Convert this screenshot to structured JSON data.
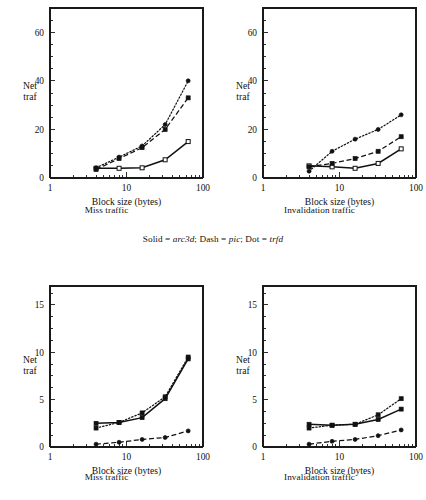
{
  "figure": {
    "legend_prefix_solid": "Solid = ",
    "legend_solid_name": "arc3d",
    "legend_mid1": "; Dash = ",
    "legend_dash_name": "pic",
    "legend_mid2": "; Dot = ",
    "legend_dot_name": "trfd",
    "legend_full": "Solid = arc3d; Dash = pic; Dot = trfd"
  },
  "axes": {
    "xlabel": "Block size (bytes)",
    "ylabel_line1": "Net",
    "ylabel_line2": "traf",
    "x_tick_labels": [
      "1",
      "10",
      "100"
    ],
    "y_tick_labels_top": [
      "0",
      "20",
      "40",
      "60"
    ],
    "y_tick_labels_bottom": [
      "0",
      "5",
      "10",
      "15"
    ]
  },
  "captions": {
    "miss": "Miss traffic",
    "invalidation": "Invalidation traffic"
  },
  "chart_data": [
    {
      "id": "top-left",
      "type": "line",
      "title": "Miss traffic",
      "subtitle": "",
      "xlabel": "Block size (bytes)",
      "ylabel": "Net traf",
      "xscale": "log",
      "xlim": [
        1,
        100
      ],
      "ylim": [
        0,
        70
      ],
      "yticks": [
        0,
        20,
        40,
        60
      ],
      "xticks": [
        1,
        10,
        100
      ],
      "grid": false,
      "legend_position": "external-center",
      "x": [
        4,
        8,
        16,
        32,
        64
      ],
      "series": [
        {
          "name": "arc3d",
          "style": "solid",
          "marker": "open-square",
          "values": [
            4.0,
            4.0,
            4.2,
            7.5,
            15.0
          ]
        },
        {
          "name": "pic",
          "style": "dash",
          "marker": "filled-square",
          "values": [
            3.5,
            8.0,
            12.5,
            20.0,
            33.0
          ]
        },
        {
          "name": "trfd",
          "style": "dot",
          "marker": "filled-circle",
          "values": [
            4.2,
            8.6,
            13.2,
            22.0,
            40.0
          ]
        }
      ]
    },
    {
      "id": "top-right",
      "type": "line",
      "title": "Invalidation traffic",
      "subtitle": "",
      "xlabel": "Block size (bytes)",
      "ylabel": "Net traf",
      "xscale": "log",
      "xlim": [
        1,
        100
      ],
      "ylim": [
        0,
        70
      ],
      "yticks": [
        0,
        20,
        40,
        60
      ],
      "xticks": [
        1,
        10,
        100
      ],
      "grid": false,
      "legend_position": "external-center",
      "x": [
        4,
        8,
        16,
        32,
        64
      ],
      "series": [
        {
          "name": "arc3d",
          "style": "solid",
          "marker": "open-square",
          "values": [
            5.0,
            4.6,
            4.0,
            6.0,
            12.0
          ]
        },
        {
          "name": "pic",
          "style": "dash",
          "marker": "filled-square",
          "values": [
            4.6,
            6.0,
            8.0,
            11.0,
            17.0
          ]
        },
        {
          "name": "trfd",
          "style": "dot",
          "marker": "filled-circle",
          "values": [
            2.8,
            11.0,
            16.0,
            20.0,
            26.0
          ]
        }
      ]
    },
    {
      "id": "bottom-left",
      "type": "line",
      "title": "Miss traffic",
      "subtitle": "",
      "xlabel": "Block size (bytes)",
      "ylabel": "Net traf",
      "xscale": "log",
      "xlim": [
        1,
        100
      ],
      "ylim": [
        0,
        17
      ],
      "yticks": [
        0,
        5,
        10,
        15
      ],
      "xticks": [
        1,
        10,
        100
      ],
      "grid": false,
      "legend_position": "external-center",
      "x": [
        4,
        8,
        16,
        32,
        64
      ],
      "series": [
        {
          "name": "arc3d",
          "style": "solid",
          "marker": "filled-square",
          "values": [
            2.5,
            2.6,
            3.1,
            5.1,
            9.3
          ]
        },
        {
          "name": "pic",
          "style": "dash",
          "marker": "filled-circle",
          "values": [
            0.3,
            0.5,
            0.8,
            1.0,
            1.7
          ]
        },
        {
          "name": "trfd",
          "style": "dot",
          "marker": "filled-square",
          "values": [
            2.0,
            2.6,
            3.6,
            5.3,
            9.5
          ]
        }
      ]
    },
    {
      "id": "bottom-right",
      "type": "line",
      "title": "Invalidation traffic",
      "subtitle": "",
      "xlabel": "Block size (bytes)",
      "ylabel": "Net traf",
      "xscale": "log",
      "xlim": [
        1,
        100
      ],
      "ylim": [
        0,
        17
      ],
      "yticks": [
        0,
        5,
        10,
        15
      ],
      "xticks": [
        1,
        10,
        100
      ],
      "grid": false,
      "legend_position": "external-center",
      "x": [
        4,
        8,
        16,
        32,
        64
      ],
      "series": [
        {
          "name": "arc3d",
          "style": "solid",
          "marker": "filled-square",
          "values": [
            2.4,
            2.3,
            2.4,
            2.9,
            4.0
          ]
        },
        {
          "name": "pic",
          "style": "dash",
          "marker": "filled-circle",
          "values": [
            0.3,
            0.6,
            0.8,
            1.2,
            1.8
          ]
        },
        {
          "name": "trfd",
          "style": "dot",
          "marker": "filled-square",
          "values": [
            2.0,
            2.3,
            2.4,
            3.4,
            5.1
          ]
        }
      ]
    }
  ]
}
